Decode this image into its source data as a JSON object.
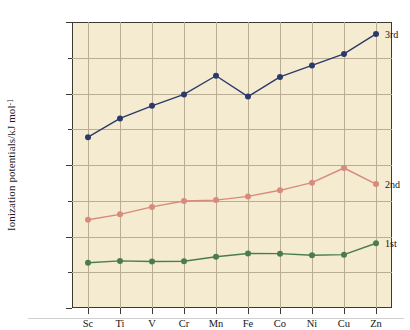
{
  "chart_data": {
    "type": "line",
    "title": "",
    "xlabel": "",
    "ylabel": "Ionization potentials/kJ mol",
    "ylabel_exponent": "-1",
    "categories": [
      "Sc",
      "Ti",
      "V",
      "Cr",
      "Mn",
      "Fe",
      "Co",
      "Ni",
      "Cu",
      "Zn"
    ],
    "ylim": [
      0,
      4000
    ],
    "ytick_labels": [
      "0",
      "1000",
      "2000",
      "3000",
      "4000"
    ],
    "ytick_values": [
      0,
      1000,
      2000,
      3000,
      4000
    ],
    "yminor_values": [
      500,
      1500,
      2500,
      3500
    ],
    "grid": true,
    "legend_position": "right-inline",
    "series": [
      {
        "name": "1st",
        "label": "1st",
        "color": "#4a7c4e",
        "values": [
          633,
          659,
          651,
          653,
          717,
          762,
          760,
          737,
          746,
          906
        ]
      },
      {
        "name": "2nd",
        "label": "2nd",
        "color": "#d98a7a",
        "values": [
          1235,
          1310,
          1414,
          1496,
          1509,
          1561,
          1646,
          1753,
          1958,
          1733
        ]
      },
      {
        "name": "3rd",
        "label": "3rd",
        "color": "#2c3a6b",
        "values": [
          2389,
          2652,
          2828,
          2987,
          3248,
          2957,
          3232,
          3393,
          3554,
          3833
        ]
      }
    ],
    "plot_background": "#f4ebd0",
    "grid_color": "#b9ae93",
    "axis_color": "#3a3a32"
  }
}
